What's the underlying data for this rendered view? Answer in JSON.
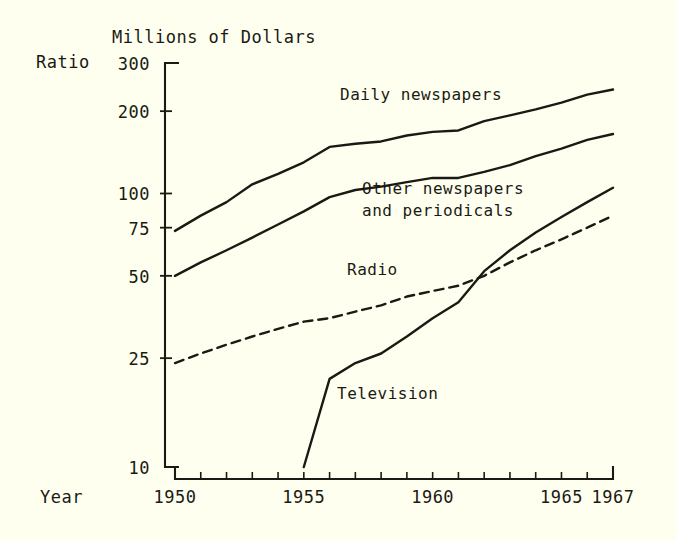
{
  "chart_data": {
    "type": "line",
    "title": "Millions of Dollars",
    "xlabel": "Year",
    "ylabel": "Ratio",
    "scale": "log",
    "grid": false,
    "legend": "inline-annotations",
    "x": [
      1950,
      1951,
      1952,
      1953,
      1954,
      1955,
      1956,
      1957,
      1958,
      1959,
      1960,
      1961,
      1962,
      1963,
      1964,
      1965,
      1966,
      1967
    ],
    "xlim": [
      1950,
      1967
    ],
    "ylim": [
      10,
      300
    ],
    "ytick_labels": [
      "300",
      "200",
      "100",
      "75",
      "50",
      "25",
      "10"
    ],
    "ytick_values": [
      300,
      200,
      100,
      75,
      50,
      25,
      10
    ],
    "xtick_labels": [
      "1950",
      "1955",
      "1960",
      "1965",
      "1967"
    ],
    "xtick_values": [
      1950,
      1955,
      1960,
      1965,
      1967
    ],
    "series": [
      {
        "name": "Daily newspapers",
        "style": "solid",
        "values": [
          73,
          83,
          93,
          108,
          118,
          130,
          148,
          152,
          155,
          163,
          168,
          170,
          184,
          193,
          203,
          215,
          230,
          240
        ]
      },
      {
        "name": "Other newspapers and periodicals",
        "style": "solid",
        "values": [
          50,
          56,
          62,
          69,
          77,
          86,
          97,
          103,
          106,
          110,
          114,
          114,
          120,
          127,
          137,
          146,
          157,
          165
        ]
      },
      {
        "name": "Radio",
        "style": "dashed",
        "values": [
          24,
          26,
          28,
          30,
          32,
          34,
          35,
          37,
          39,
          42,
          44,
          46,
          50,
          56,
          62,
          68,
          75,
          83
        ]
      },
      {
        "name": "Television",
        "style": "solid",
        "values": [
          null,
          null,
          null,
          null,
          null,
          10,
          21,
          24,
          26,
          30,
          35,
          40,
          52,
          62,
          72,
          82,
          93,
          105
        ]
      }
    ]
  },
  "labels": {
    "title": "Millions of Dollars",
    "ratio": "Ratio",
    "year": "Year",
    "daily": "Daily newspapers",
    "other_line1": "Other newspapers",
    "other_line2": "and periodicals",
    "radio": "Radio",
    "television": "Television"
  },
  "colors": {
    "background": "#fffff0",
    "ink": "#1a1a14"
  }
}
